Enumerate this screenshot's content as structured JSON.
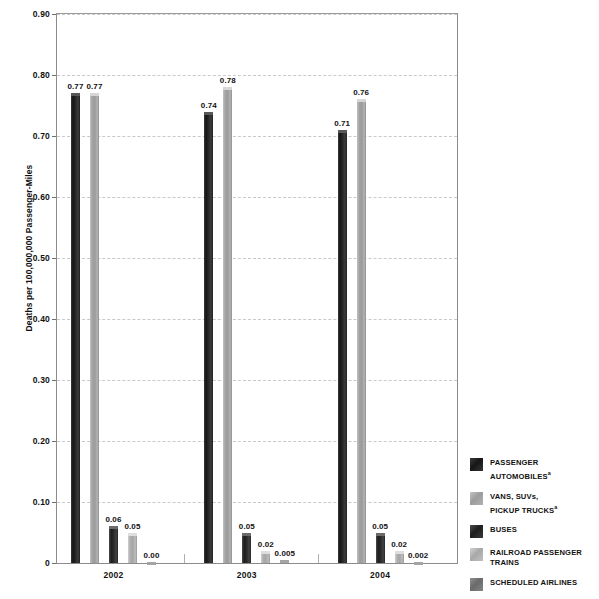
{
  "chart_data": {
    "type": "bar",
    "title": "",
    "xlabel": "",
    "ylabel": "Deaths per 100,000,000 Passenger-Miles",
    "categories": [
      "2002",
      "2003",
      "2004"
    ],
    "ylim": [
      0,
      0.9
    ],
    "ytick_labels": [
      "0",
      "0.10",
      "0.20",
      "0.30",
      "0.40",
      "0.50",
      "0.60",
      "0.70",
      "0.80",
      "0.90"
    ],
    "ytick_values": [
      0,
      0.1,
      0.2,
      0.3,
      0.4,
      0.5,
      0.6,
      0.7,
      0.8,
      0.9
    ],
    "grid": "horizontal-dashed",
    "legend_position": "right",
    "series": [
      {
        "name": "PASSENGER AUTOMOBILES",
        "superscript": "a",
        "color": "#262626",
        "values": [
          0.77,
          0.74,
          0.71
        ],
        "labels": [
          "0.77",
          "0.74",
          "0.71"
        ]
      },
      {
        "name": "VANS, SUVs, PICKUP TRUCKS",
        "superscript": "a",
        "color": "#a3a3a3",
        "values": [
          0.77,
          0.78,
          0.76
        ],
        "labels": [
          "0.77",
          "0.78",
          "0.76"
        ]
      },
      {
        "name": "BUSES",
        "superscript": "",
        "color": "#2c2c2c",
        "values": [
          0.06,
          0.05,
          0.05
        ],
        "labels": [
          "0.06",
          "0.05",
          "0.05"
        ]
      },
      {
        "name": "RAILROAD PASSENGER TRAINS",
        "superscript": "",
        "color": "#a6a6a6",
        "values": [
          0.05,
          0.02,
          0.02
        ],
        "labels": [
          "0.05",
          "0.02",
          "0.02"
        ]
      },
      {
        "name": "SCHEDULED AIRLINES",
        "superscript": "",
        "color": "#7a7a7a",
        "values": [
          0.0,
          0.005,
          0.002
        ],
        "labels": [
          "0.00",
          "0.005",
          "0.002"
        ]
      }
    ]
  },
  "legend": {
    "items": [
      {
        "line1": "PASSENGER",
        "line2": "AUTOMOBILES",
        "sup": "a"
      },
      {
        "line1": "VANS, SUVs,",
        "line2": "PICKUP TRUCKS",
        "sup": "a"
      },
      {
        "line1": "BUSES",
        "line2": "",
        "sup": ""
      },
      {
        "line1": "RAILROAD PASSENGER",
        "line2": "TRAINS",
        "sup": ""
      },
      {
        "line1": "SCHEDULED AIRLINES",
        "line2": "",
        "sup": ""
      }
    ]
  }
}
